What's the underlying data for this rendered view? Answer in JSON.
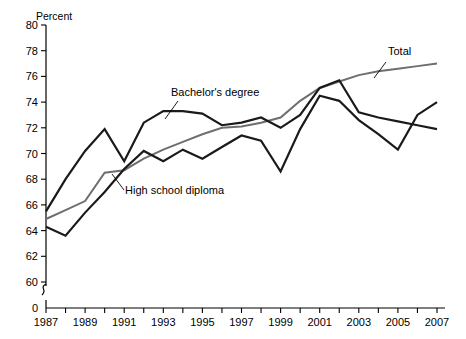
{
  "chart_data": {
    "type": "line",
    "title": "",
    "subtitle": "",
    "xlabel": "",
    "ylabel": "Percent",
    "ylim": [
      59,
      80
    ],
    "xlim": [
      1987,
      2007
    ],
    "grid": false,
    "legend_position": "inline-annotations",
    "axis_break": true,
    "axis_break_note": "y-axis broken between 0 and 60",
    "y_ticks": [
      0,
      60,
      62,
      64,
      66,
      68,
      70,
      72,
      74,
      76,
      78,
      80
    ],
    "y_tick_labels": [
      "0",
      "60",
      "62",
      "64",
      "66",
      "68",
      "70",
      "72",
      "74",
      "76",
      "78",
      "80"
    ],
    "x": [
      1987,
      1988,
      1989,
      1990,
      1991,
      1992,
      1993,
      1994,
      1995,
      1996,
      1997,
      1998,
      1999,
      2000,
      2001,
      2002,
      2003,
      2004,
      2005,
      2006,
      2007
    ],
    "x_tick_labels": [
      "1987",
      "",
      "1989",
      "",
      "1991",
      "",
      "1993",
      "",
      "1995",
      "",
      "1997",
      "",
      "1999",
      "",
      "2001",
      "",
      "2003",
      "",
      "2005",
      "",
      "2007"
    ],
    "x_ticks_minor_every": 1,
    "series": [
      {
        "name": "Total",
        "color": "#6e6e6e",
        "width": 2.0,
        "values": [
          64.9,
          65.6,
          66.3,
          68.5,
          68.7,
          69.6,
          70.3,
          70.9,
          71.5,
          72.0,
          72.1,
          72.4,
          72.8,
          74.1,
          75.1,
          75.6,
          76.1,
          76.4,
          76.6,
          76.8,
          77.0
        ]
      },
      {
        "name": "Bachelor's degree",
        "color": "#1a1a1a",
        "width": 2.2,
        "values": [
          65.5,
          68.0,
          70.2,
          71.9,
          69.4,
          72.4,
          73.3,
          73.3,
          73.1,
          72.2,
          72.4,
          72.8,
          72.0,
          73.0,
          75.1,
          75.7,
          73.2,
          72.8,
          72.5,
          72.2,
          71.9
        ]
      },
      {
        "name": "High school diploma",
        "color": "#1a1a1a",
        "width": 2.2,
        "values": [
          64.3,
          63.6,
          65.4,
          67.0,
          68.8,
          70.2,
          69.4,
          70.3,
          69.6,
          70.5,
          71.4,
          71.0,
          68.6,
          71.9,
          74.5,
          74.1,
          72.6,
          71.5,
          70.3,
          73.0,
          74.0
        ]
      }
    ],
    "annotations": [
      {
        "text": "Total",
        "x_px": 388,
        "y_px": 55,
        "leader_from_px": [
          386,
          62
        ],
        "leader_to_px": [
          374,
          78
        ]
      },
      {
        "text": "Bachelor's degree",
        "x_px": 171,
        "y_px": 96,
        "leader_from_px": [
          178,
          101
        ],
        "leader_to_px": [
          165,
          119
        ]
      },
      {
        "text": "High school diploma",
        "x_px": 125,
        "y_px": 194,
        "leader_from_px": [
          124,
          190
        ],
        "leader_to_px": [
          112,
          174
        ]
      }
    ]
  }
}
